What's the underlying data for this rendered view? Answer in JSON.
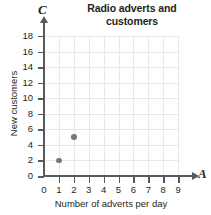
{
  "chart_data": {
    "type": "scatter",
    "title": "Radio adverts and customers",
    "title_lines": [
      "Radio adverts and",
      "customers"
    ],
    "xlabel": "Number of adverts per day",
    "ylabel": "New customers",
    "x_axis_letter": "A",
    "y_axis_letter": "C",
    "xlim": [
      0,
      9
    ],
    "ylim": [
      0,
      18
    ],
    "x_ticks": [
      0,
      1,
      2,
      3,
      4,
      5,
      6,
      7,
      8,
      9
    ],
    "y_ticks": [
      0,
      2,
      4,
      6,
      8,
      10,
      12,
      14,
      16,
      18
    ],
    "x_tick_labels": [
      "0",
      "1",
      "2",
      "3",
      "4",
      "5",
      "6",
      "7",
      "8",
      "9"
    ],
    "y_tick_labels": [
      "0",
      "2",
      "4",
      "6",
      "8",
      "10",
      "12",
      "14",
      "16",
      "18"
    ],
    "grid": true,
    "legend": null,
    "points": [
      {
        "x": 1,
        "y": 2
      },
      {
        "x": 2,
        "y": 5
      }
    ],
    "colors": {
      "point": "#77787b",
      "axis": "#58595b",
      "grid": "#e8e8e8",
      "text": "#231f20"
    }
  }
}
